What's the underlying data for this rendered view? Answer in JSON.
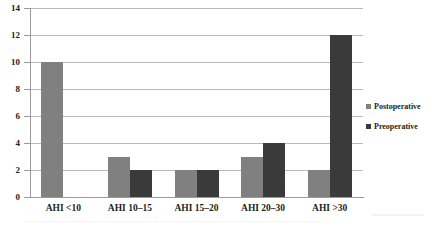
{
  "chart_data": {
    "type": "bar",
    "title": "",
    "xlabel": "",
    "ylabel": "",
    "categories": [
      "AHI <10",
      "AHI 10–15",
      "AHI 15–20",
      "AHI 20–30",
      "AHI >30"
    ],
    "series": [
      {
        "name": "Postoperative",
        "color": "#808080",
        "values": [
          10,
          3,
          2,
          3,
          2
        ]
      },
      {
        "name": "Preoperative",
        "color": "#3a3a3a",
        "values": [
          0,
          2,
          2,
          4,
          12
        ]
      }
    ],
    "ylim": [
      0,
      14
    ],
    "ytick_labels": [
      "0",
      "2",
      "4",
      "6",
      "8",
      "10",
      "12",
      "14"
    ],
    "ytick_values": [
      0,
      2,
      4,
      6,
      8,
      10,
      12,
      14
    ],
    "grid": true,
    "legend_position": "right"
  },
  "legend": {
    "items": [
      {
        "label": "Postoperative",
        "color": "#808080"
      },
      {
        "label": "Preoperative",
        "color": "#3a3a3a"
      }
    ]
  },
  "colors": {
    "postoperative": "#808080",
    "preoperative": "#3a3a3a",
    "gridline": "#b9b9b9",
    "axis": "#9a9a9a",
    "text": "#231f20",
    "background": "#ffffff"
  }
}
